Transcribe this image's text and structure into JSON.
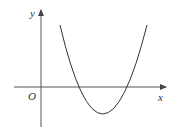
{
  "diagram": {
    "type": "function-graph",
    "axes": {
      "x_label": "x",
      "y_label": "y",
      "origin_label": "O"
    },
    "curve": {
      "kind": "parabola",
      "opens": "up",
      "roots": "two positive roots",
      "vertex": "below x-axis, right of y-axis"
    },
    "colors": {
      "axis": "#555555",
      "curve": "#333333",
      "background": "#ffffff"
    }
  }
}
